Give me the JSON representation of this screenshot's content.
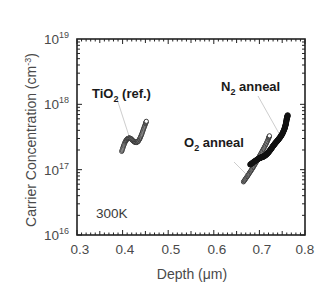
{
  "chart_data": {
    "type": "scatter",
    "title": "",
    "xlabel": "Depth (μm)",
    "ylabel": "Carrier Concentration (cm⁻³)",
    "xlim": [
      0.3,
      0.8
    ],
    "ylim": [
      1e+16,
      1e+19
    ],
    "yscale": "log",
    "xticks": [
      0.3,
      0.4,
      0.5,
      0.6,
      0.7,
      0.8
    ],
    "xtick_labels": [
      "0.3",
      "0.4",
      "0.5",
      "0.6",
      "0.7",
      "0.8"
    ],
    "yticks": [
      1e+16,
      1e+17,
      1e+18,
      1e+19
    ],
    "ytick_labels": [
      {
        "base": "10",
        "exp": "16"
      },
      {
        "base": "10",
        "exp": "17"
      },
      {
        "base": "10",
        "exp": "18"
      },
      {
        "base": "10",
        "exp": "19"
      }
    ],
    "grid": false,
    "legend": null,
    "annotations": [
      {
        "text": "TiO2 (ref.)",
        "base": "TiO",
        "sub": "2",
        "rest": " (ref.)"
      },
      {
        "text": "N2 anneal",
        "base": "N",
        "sub": "2",
        "rest": " anneal"
      },
      {
        "text": "O2 anneal",
        "base": "O",
        "sub": "2",
        "rest": " anneal"
      },
      {
        "text": "300K"
      }
    ],
    "series": [
      {
        "name": "TiO2 (ref.)",
        "marker": "open-circle",
        "x": [
          0.398,
          0.402,
          0.406,
          0.41,
          0.414,
          0.418,
          0.422,
          0.426,
          0.43,
          0.434,
          0.438,
          0.442,
          0.446,
          0.45,
          0.452
        ],
        "y": [
          1.9e+17,
          2.3e+17,
          2.7e+17,
          2.95e+17,
          3.05e+17,
          3e+17,
          2.8e+17,
          2.65e+17,
          2.6e+17,
          2.7e+17,
          3e+17,
          3.5e+17,
          4.2e+17,
          5e+17,
          5.5e+17
        ]
      },
      {
        "name": "O2 anneal",
        "marker": "open-circle",
        "x": [
          0.665,
          0.67,
          0.675,
          0.68,
          0.685,
          0.69,
          0.695,
          0.7,
          0.705,
          0.71,
          0.715,
          0.72,
          0.722
        ],
        "y": [
          6.5e+16,
          7.3e+16,
          8.2e+16,
          9.3e+16,
          1.05e+17,
          1.2e+17,
          1.38e+17,
          1.6e+17,
          1.85e+17,
          2.15e+17,
          2.5e+17,
          3e+17,
          3.3e+17
        ]
      },
      {
        "name": "N2 anneal",
        "marker": "filled-circle",
        "x": [
          0.68,
          0.69,
          0.7,
          0.705,
          0.71,
          0.715,
          0.72,
          0.725,
          0.73,
          0.735,
          0.74,
          0.745,
          0.75,
          0.755,
          0.758,
          0.76,
          0.762
        ],
        "y": [
          1.2e+17,
          1.35e+17,
          1.5e+17,
          1.55e+17,
          1.6e+17,
          1.7e+17,
          1.85e+17,
          2.05e+17,
          2.3e+17,
          2.55e+17,
          2.8e+17,
          3.1e+17,
          3.5e+17,
          4.2e+17,
          5e+17,
          6e+17,
          6.8e+17
        ]
      }
    ]
  },
  "labels": {
    "ylabel_main": "Carrier Concentration (cm",
    "ylabel_sup": "-3",
    "ylabel_end": ")",
    "xlabel_main": "Depth (",
    "xlabel_mu": "μ",
    "xlabel_end": "m)",
    "temperature": "300K",
    "tio2_base": "TiO",
    "tio2_sub": "2",
    "tio2_rest": " (ref.)",
    "n2_base": "N",
    "n2_sub": "2",
    "n2_rest": " anneal",
    "o2_base": "O",
    "o2_sub": "2",
    "o2_rest": " anneal"
  },
  "colors": {
    "axis": "#222222",
    "text": "#4a4a4a",
    "series_open": "#333333",
    "series_filled": "#111111",
    "leader": "#b0b0b0"
  }
}
